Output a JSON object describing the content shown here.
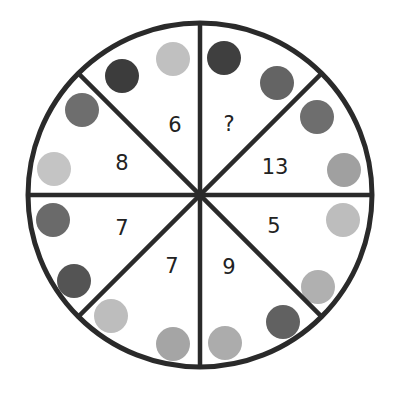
{
  "puzzle": {
    "center": [
      200,
      195
    ],
    "radius": 172,
    "stroke_color": "#2a2a2a",
    "colors": {
      "dark": "#3f3f3f",
      "medium": "#6e6e6e",
      "light": "#b4b4b4",
      "lighter": "#c8c8c8"
    },
    "segments": [
      {
        "label": "?",
        "pos": [
          229,
          124
        ],
        "dots": [
          {
            "x": 224,
            "y": 58,
            "c": "#3f3f3f"
          },
          {
            "x": 277,
            "y": 83,
            "c": "#646464"
          }
        ]
      },
      {
        "label": "13",
        "pos": [
          275,
          167
        ],
        "dots": [
          {
            "x": 317,
            "y": 117,
            "c": "#6e6e6e"
          },
          {
            "x": 344,
            "y": 170,
            "c": "#a0a0a0"
          }
        ]
      },
      {
        "label": "5",
        "pos": [
          274,
          226
        ],
        "dots": [
          {
            "x": 343,
            "y": 220,
            "c": "#bdbdbd"
          },
          {
            "x": 318,
            "y": 287,
            "c": "#b0b0b0"
          }
        ]
      },
      {
        "label": "9",
        "pos": [
          229,
          267
        ],
        "dots": [
          {
            "x": 283,
            "y": 322,
            "c": "#616161"
          },
          {
            "x": 225,
            "y": 343,
            "c": "#acacac"
          }
        ]
      },
      {
        "label": "7",
        "pos": [
          172,
          266
        ],
        "dots": [
          {
            "x": 111,
            "y": 316,
            "c": "#bdbdbd"
          },
          {
            "x": 173,
            "y": 344,
            "c": "#a5a5a5"
          }
        ]
      },
      {
        "label": "7",
        "pos": [
          122,
          228
        ],
        "dots": [
          {
            "x": 53,
            "y": 220,
            "c": "#6a6a6a"
          },
          {
            "x": 74,
            "y": 281,
            "c": "#545454"
          }
        ]
      },
      {
        "label": "8",
        "pos": [
          122,
          163
        ],
        "dots": [
          {
            "x": 54,
            "y": 169,
            "c": "#c4c4c4"
          },
          {
            "x": 82,
            "y": 110,
            "c": "#6e6e6e"
          }
        ]
      },
      {
        "label": "6",
        "pos": [
          175,
          125
        ],
        "dots": [
          {
            "x": 122,
            "y": 76,
            "c": "#3c3c3c"
          },
          {
            "x": 173,
            "y": 59,
            "c": "#c0c0c0"
          }
        ]
      }
    ]
  }
}
